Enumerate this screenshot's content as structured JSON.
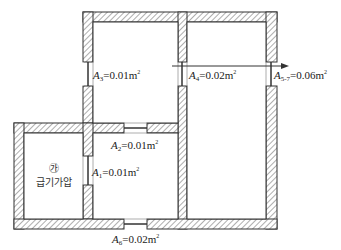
{
  "diagram": {
    "type": "floor-plan-airflow",
    "colors": {
      "wall_hatch": "#555555",
      "wall_fill": "#ffffff",
      "line": "#333333",
      "text": "#222222"
    },
    "room_label": {
      "marker": "㉮",
      "name": "급기가압"
    },
    "openings": [
      {
        "id": "A3",
        "symbol": "A",
        "subscript": "3",
        "value": "=0.01m",
        "unit_sup": "2"
      },
      {
        "id": "A4",
        "symbol": "A",
        "subscript": "4",
        "value": "=0.02m",
        "unit_sup": "2"
      },
      {
        "id": "A5-7",
        "symbol": "A",
        "subscript": "5-7",
        "value": "=0.06m",
        "unit_sup": "2"
      },
      {
        "id": "A2",
        "symbol": "A",
        "subscript": "2",
        "value": "=0.01m",
        "unit_sup": "2"
      },
      {
        "id": "A1",
        "symbol": "A",
        "subscript": "1",
        "value": "=0.01m",
        "unit_sup": "2"
      },
      {
        "id": "A6",
        "symbol": "A",
        "subscript": "6",
        "value": "=0.02m",
        "unit_sup": "2"
      }
    ],
    "arrow": {
      "direction": "right",
      "description": "airflow exit arrow"
    }
  }
}
